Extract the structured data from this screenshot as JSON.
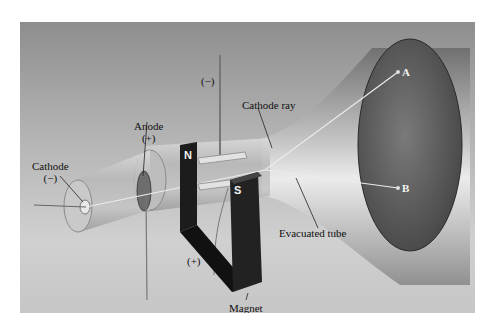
{
  "figure": {
    "type": "cathode-ray-tube-diagram",
    "labels": {
      "cathode": "Cathode",
      "cathode_sign": "(−)",
      "anode": "Anode",
      "anode_sign": "(+)",
      "top_plate_sign": "(−)",
      "bottom_plate_sign": "(+)",
      "cathode_ray": "Cathode ray",
      "evacuated_tube": "Evacuated tube",
      "magnet": "Magnet",
      "magnet_north": "N",
      "magnet_south": "S",
      "point_a": "A",
      "point_b": "B"
    },
    "colors": {
      "background_top": "#8e8e8e",
      "background_bottom": "#cfcfcf",
      "tube_glass": "#c8c8c8",
      "screen": "#5a5a5a",
      "magnet": "#1c1c1c",
      "ray": "#e8e8e8"
    }
  }
}
